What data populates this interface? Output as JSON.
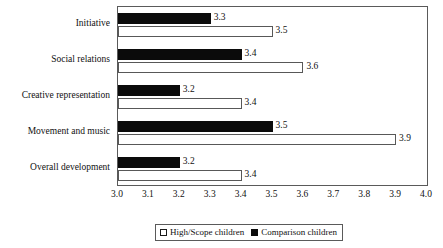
{
  "chart_data": {
    "type": "bar",
    "orientation": "horizontal",
    "title": "",
    "subtitle": "",
    "xlabel": "",
    "ylabel": "",
    "xlim": [
      3.0,
      4.0
    ],
    "xticks": [
      "3.0",
      "3.1",
      "3.2",
      "3.3",
      "3.4",
      "3.5",
      "3.6",
      "3.7",
      "3.8",
      "3.9",
      "4.0"
    ],
    "grid": false,
    "legend_position": "bottom",
    "categories": [
      "Initiative",
      "Social relations",
      "Creative representation",
      "Movement and music",
      "Overall development"
    ],
    "series": [
      {
        "name": "Comparison children",
        "color": "#0b0b0b",
        "style": "filled",
        "values": [
          3.3,
          3.4,
          3.2,
          3.5,
          3.2
        ],
        "labels": [
          "3.3",
          "3.4",
          "3.2",
          "3.5",
          "3.2"
        ]
      },
      {
        "name": "High/Scope children",
        "color": "#ffffff",
        "style": "open",
        "values": [
          3.5,
          3.6,
          3.4,
          3.9,
          3.4
        ],
        "labels": [
          "3.5",
          "3.6",
          "3.4",
          "3.9",
          "3.4"
        ]
      }
    ]
  },
  "legend": {
    "entries": [
      {
        "label": "High/Scope children",
        "style": "open"
      },
      {
        "label": "Comparison children",
        "style": "filled"
      }
    ]
  },
  "colors": {
    "comparison": "#0b0b0b",
    "highscope": "#ffffff",
    "axis": "#5a5a5a",
    "text": "#111111"
  }
}
